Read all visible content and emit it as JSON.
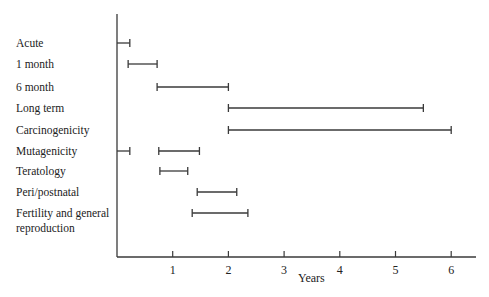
{
  "chart_data": {
    "type": "gantt-range",
    "title": "",
    "xlabel": "Years",
    "ylabel": "",
    "xlim": [
      0,
      6.4
    ],
    "xticks": [
      1,
      2,
      3,
      4,
      5,
      6
    ],
    "grid": false,
    "legend": null,
    "rows": [
      {
        "label": "Acute",
        "ranges": [
          [
            0,
            0.23
          ]
        ]
      },
      {
        "label": "1 month",
        "ranges": [
          [
            0.2,
            0.72
          ]
        ]
      },
      {
        "label": "6 month",
        "ranges": [
          [
            0.72,
            2.0
          ]
        ]
      },
      {
        "label": "Long term",
        "ranges": [
          [
            2.0,
            5.5
          ]
        ]
      },
      {
        "label": "Carcinogenicity",
        "ranges": [
          [
            2.0,
            6.0
          ]
        ]
      },
      {
        "label": "Mutagenicity",
        "ranges": [
          [
            0,
            0.23
          ],
          [
            0.75,
            1.48
          ]
        ]
      },
      {
        "label": "Teratology",
        "ranges": [
          [
            0.77,
            1.27
          ]
        ]
      },
      {
        "label": "Peri/postnatal",
        "ranges": [
          [
            1.44,
            2.15
          ]
        ]
      },
      {
        "label": "Fertility and general\nreproduction",
        "ranges": [
          [
            1.35,
            2.35
          ]
        ]
      }
    ]
  }
}
